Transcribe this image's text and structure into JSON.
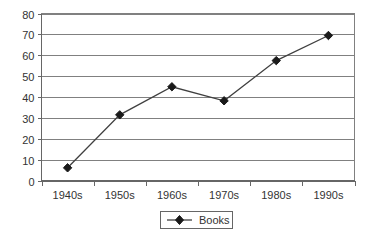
{
  "chart_data": {
    "type": "line",
    "title": "",
    "subtitle": "",
    "xlabel": "",
    "ylabel": "",
    "categories": [
      "1940s",
      "1950s",
      "1960s",
      "1970s",
      "1980s",
      "1990s"
    ],
    "series": [
      {
        "name": "Books",
        "values": [
          6.3,
          31.6,
          45.0,
          38.3,
          57.5,
          69.5
        ],
        "marker": "diamond",
        "color": "#1a1a1a"
      }
    ],
    "ylim": [
      0,
      80
    ],
    "yticks": [
      0,
      10,
      20,
      30,
      40,
      50,
      60,
      70,
      80
    ],
    "ytick_labels": [
      "0",
      "10",
      "20",
      "30",
      "40",
      "50",
      "60",
      "70",
      "80"
    ],
    "grid": "horizontal",
    "legend_position": "bottom-center",
    "legend_entries": [
      "Books"
    ],
    "background": "#ffffff",
    "gridline_color": "#808080",
    "axis_color": "#666666"
  },
  "legend": {
    "books_label": "Books"
  }
}
